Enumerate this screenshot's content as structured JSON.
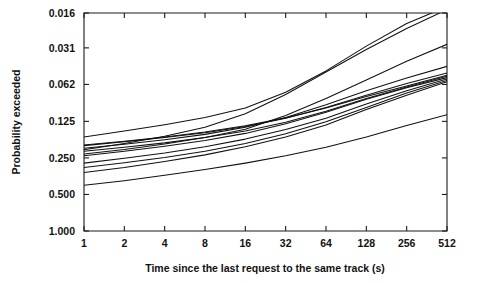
{
  "chart_data": {
    "type": "line",
    "title": "",
    "subtitle": "",
    "xlabel": "Time since the last request to the same track (s)",
    "ylabel": "Probability exceeded",
    "grid": false,
    "legend": "none",
    "x_scale": "log2",
    "y_scale": "log2-reversed",
    "xlim": [
      1,
      512
    ],
    "ylim": [
      1.0,
      0.016
    ],
    "x_ticks": [
      1,
      2,
      4,
      8,
      16,
      32,
      64,
      128,
      256,
      512
    ],
    "x_tick_labels": [
      "1",
      "2",
      "4",
      "8",
      "16",
      "32",
      "64",
      "128",
      "256",
      "512"
    ],
    "y_ticks": [
      0.016,
      0.031,
      0.062,
      0.125,
      0.25,
      0.5,
      1.0
    ],
    "y_tick_labels": [
      "0.016",
      "0.031",
      "0.062",
      "0.125",
      "0.250",
      "0.500",
      "1.000"
    ],
    "x": [
      1,
      2,
      4,
      8,
      16,
      32,
      64,
      128,
      256,
      512
    ],
    "series": [
      {
        "name": "trace-1",
        "values": [
          0.168,
          0.15,
          0.133,
          0.116,
          0.097,
          0.072,
          0.048,
          0.03,
          0.0195,
          0.0142
        ]
      },
      {
        "name": "trace-2",
        "values": [
          0.214,
          0.19,
          0.166,
          0.14,
          0.108,
          0.075,
          0.049,
          0.032,
          0.0215,
          0.015
        ]
      },
      {
        "name": "trace-3",
        "values": [
          0.232,
          0.213,
          0.192,
          0.17,
          0.145,
          0.112,
          0.081,
          0.057,
          0.04,
          0.029
        ]
      },
      {
        "name": "trace-4",
        "values": [
          0.208,
          0.193,
          0.177,
          0.16,
          0.14,
          0.116,
          0.091,
          0.07,
          0.055,
          0.044
        ]
      },
      {
        "name": "trace-5",
        "values": [
          0.198,
          0.184,
          0.17,
          0.155,
          0.138,
          0.118,
          0.096,
          0.076,
          0.061,
          0.05
        ]
      },
      {
        "name": "trace-6",
        "values": [
          0.196,
          0.182,
          0.168,
          0.153,
          0.136,
          0.117,
          0.097,
          0.078,
          0.064,
          0.052
        ]
      },
      {
        "name": "trace-7",
        "values": [
          0.22,
          0.204,
          0.188,
          0.17,
          0.15,
          0.127,
          0.103,
          0.081,
          0.065,
          0.053
        ]
      },
      {
        "name": "trace-8",
        "values": [
          0.24,
          0.22,
          0.2,
          0.18,
          0.157,
          0.131,
          0.105,
          0.082,
          0.066,
          0.0545
        ]
      },
      {
        "name": "trace-9",
        "values": [
          0.276,
          0.252,
          0.228,
          0.202,
          0.175,
          0.146,
          0.118,
          0.09,
          0.07,
          0.056
        ]
      },
      {
        "name": "trace-10",
        "values": [
          0.3,
          0.274,
          0.248,
          0.22,
          0.19,
          0.158,
          0.126,
          0.096,
          0.073,
          0.0575
        ]
      },
      {
        "name": "trace-11",
        "values": [
          0.33,
          0.3,
          0.268,
          0.236,
          0.202,
          0.168,
          0.134,
          0.1,
          0.076,
          0.059
        ]
      },
      {
        "name": "trace-12",
        "values": [
          0.42,
          0.385,
          0.348,
          0.312,
          0.276,
          0.24,
          0.204,
          0.168,
          0.135,
          0.11
        ]
      }
    ]
  }
}
